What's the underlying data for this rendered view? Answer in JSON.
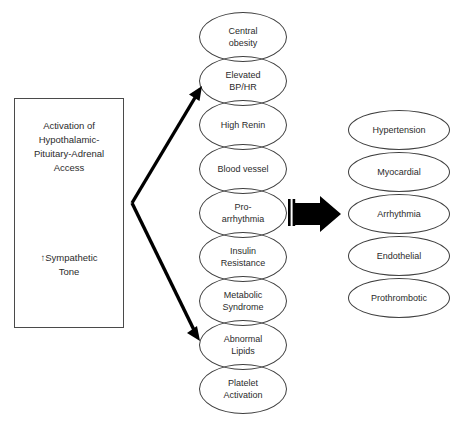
{
  "diagram": {
    "stroke_color": "#3f3f3f",
    "text_color": "#2b2b2b",
    "arrow_color": "#000000",
    "background": "#ffffff"
  },
  "source": {
    "title": "Activation of\nHypothalamic-\nPituitary-Adrenal\nAccess",
    "subtitle": "↑Sympathetic\nTone"
  },
  "mediators": [
    {
      "label": "Central\nobesity",
      "top": 12
    },
    {
      "label": "Elevated\nBP/HR",
      "top": 56
    },
    {
      "label": "High Renin",
      "top": 100
    },
    {
      "label": "Blood vessel",
      "top": 144
    },
    {
      "label": "Pro-\narrhythmia",
      "top": 188
    },
    {
      "label": "Insulin\nResistance",
      "top": 232
    },
    {
      "label": "Metabolic\nSyndrome",
      "top": 276
    },
    {
      "label": "Abnormal\nLipids",
      "top": 320
    },
    {
      "label": "Platelet\nActivation",
      "top": 364
    }
  ],
  "outcomes": [
    {
      "label": "Hypertension",
      "top": 110
    },
    {
      "label": "Myocardial",
      "top": 152
    },
    {
      "label": "Arrhythmia",
      "top": 194
    },
    {
      "label": "Endothelial",
      "top": 236
    },
    {
      "label": "Prothrombotic",
      "top": 278
    }
  ],
  "connectors": {
    "upper_arrow_name": "arrow-to-elevated-bp-hr",
    "lower_arrow_name": "arrow-to-abnormal-lipids",
    "block_arrow_name": "arrow-pro-arrhythmia-to-arrhythmia"
  }
}
